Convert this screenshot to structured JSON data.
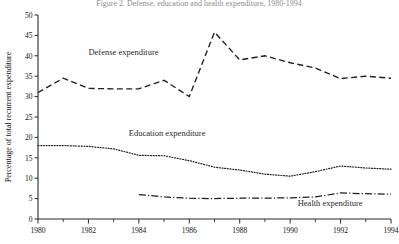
{
  "chart_data": {
    "type": "line",
    "title": "Figure 2. Defense, education and health expenditure, 1980-1994",
    "xlabel": "",
    "ylabel": "Percentage of total recurrent expenditure",
    "xlim": [
      1980,
      1994
    ],
    "ylim": [
      0,
      50
    ],
    "yticks": [
      0,
      5,
      10,
      15,
      20,
      25,
      30,
      35,
      40,
      45,
      50
    ],
    "xticks": [
      1980,
      1982,
      1984,
      1986,
      1988,
      1990,
      1992,
      1994
    ],
    "x_minor_step": 1,
    "grid": false,
    "legend": "inline-annotations",
    "x": [
      1980,
      1981,
      1982,
      1983,
      1984,
      1985,
      1986,
      1987,
      1988,
      1989,
      1990,
      1991,
      1992,
      1993,
      1994
    ],
    "series": [
      {
        "name": "Defense expenditure",
        "style": "dashed",
        "label_x": 1982.0,
        "label_y": 40.3,
        "values": [
          31.0,
          34.5,
          32.0,
          31.9,
          31.9,
          34.0,
          30.0,
          45.8,
          39.0,
          40.0,
          38.3,
          37.0,
          34.4,
          35.0,
          34.5
        ]
      },
      {
        "name": "Education expenditure",
        "style": "dotted",
        "label_x": 1983.6,
        "label_y": 20.4,
        "values": [
          18.0,
          18.0,
          17.8,
          17.2,
          15.6,
          15.5,
          14.3,
          12.7,
          12.0,
          11.0,
          10.5,
          11.6,
          13.0,
          12.5,
          12.2
        ]
      },
      {
        "name": "Health expenditure",
        "style": "dash-dot",
        "label_x": 1990.3,
        "label_y": 3.2,
        "values": [
          null,
          null,
          null,
          null,
          6.0,
          5.4,
          5.1,
          5.0,
          5.1,
          5.1,
          5.2,
          5.4,
          6.4,
          6.2,
          6.1
        ]
      }
    ]
  }
}
